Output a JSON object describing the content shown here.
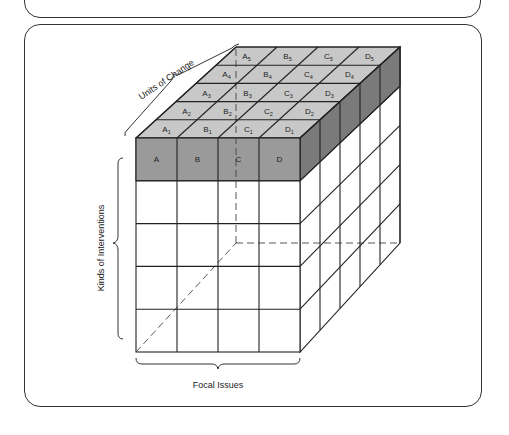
{
  "figure": {
    "axes": {
      "units_of_change": "Units of Change",
      "kinds_of_interventions": "Kinds of Interventions",
      "focal_issues": "Focal Issues"
    },
    "front_labels": [
      "A",
      "B",
      "C",
      "D"
    ],
    "top_rows": [
      {
        "labels": [
          "A",
          "B",
          "C",
          "D"
        ],
        "sub": "1"
      },
      {
        "labels": [
          "A",
          "B",
          "C",
          "D"
        ],
        "sub": "2"
      },
      {
        "labels": [
          "A",
          "B",
          "C",
          "D"
        ],
        "sub": "3"
      },
      {
        "labels": [
          "A",
          "B",
          "C",
          "D"
        ],
        "sub": "4"
      },
      {
        "labels": [
          "A",
          "B",
          "C",
          "D"
        ],
        "sub": "5"
      }
    ],
    "grid": {
      "columns": 4,
      "rows": 5,
      "depth": 5
    },
    "colors": {
      "top_face": "#c8c8c8",
      "front_shaded": "#9a9a9a",
      "side_shaded": "#7a7a7a",
      "line": "#222222"
    }
  }
}
